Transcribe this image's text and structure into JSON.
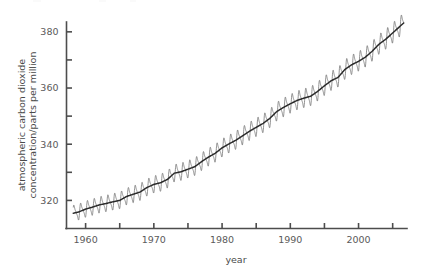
{
  "chart_data": {
    "type": "line",
    "title": "",
    "subtitle": "",
    "xlabel": "year",
    "ylabel": "atmospheric carbon dioxide concentration/parts per million",
    "ylabel_line1": "atmospheric carbon dioxide",
    "ylabel_line2": "concentration/parts per million",
    "xlim": [
      1957.2,
      2007.1
    ],
    "ylim": [
      310.0,
      383.5
    ],
    "grid": false,
    "legend": null,
    "x_major_ticks": [
      1960,
      1970,
      1980,
      1990,
      2000
    ],
    "x_major_tick_labels": [
      "1960",
      "1970",
      "1980",
      "1990",
      "2000"
    ],
    "x_minor_ticks": [
      1965,
      1975,
      1985,
      1995,
      2005
    ],
    "y_major_ticks": [
      320,
      340,
      360,
      380
    ],
    "y_major_tick_labels": [
      "320",
      "340",
      "360",
      "380"
    ],
    "y_minor_ticks": [
      330,
      350,
      370
    ],
    "series": [
      {
        "name": "monthly mean CO2 (seasonal cycle)",
        "color": "#6e6e6e",
        "x": [
          1958.0,
          1958.5,
          1959.0,
          1959.5,
          1960.0,
          1960.5,
          1961.0,
          1961.5,
          1962.0,
          1962.5,
          1963.0,
          1963.5,
          1964.0,
          1964.5,
          1965.0,
          1965.5,
          1966.0,
          1966.5,
          1967.0,
          1967.5,
          1968.0,
          1968.5,
          1969.0,
          1969.5,
          1970.0,
          1970.5,
          1971.0,
          1971.5,
          1972.0,
          1972.5,
          1973.0,
          1973.5,
          1974.0,
          1974.5,
          1975.0,
          1975.5,
          1976.0,
          1976.5,
          1977.0,
          1977.5,
          1978.0,
          1978.5,
          1979.0,
          1979.5,
          1980.0,
          1980.5,
          1981.0,
          1981.5,
          1982.0,
          1982.5,
          1983.0,
          1983.5,
          1984.0,
          1984.5,
          1985.0,
          1985.5,
          1986.0,
          1986.5,
          1987.0,
          1987.5,
          1988.0,
          1988.5,
          1989.0,
          1989.5,
          1990.0,
          1990.5,
          1991.0,
          1991.5,
          1992.0,
          1992.5,
          1993.0,
          1993.5,
          1994.0,
          1994.5,
          1995.0,
          1995.5,
          1996.0,
          1996.5,
          1997.0,
          1997.5,
          1998.0,
          1998.5,
          1999.0,
          1999.5,
          2000.0,
          2000.5,
          2001.0,
          2001.5,
          2002.0,
          2002.5,
          2003.0,
          2003.5,
          2004.0,
          2004.5,
          2005.0,
          2005.5,
          2006.0,
          2006.5
        ],
        "description": "Mauna Loa monthly mean CO2 showing annual sawtooth oscillation superimposed on rising trend"
      },
      {
        "name": "seasonally adjusted trend",
        "color": "#2b2b2b",
        "description": "Smooth rising trend line through the seasonal oscillations"
      }
    ],
    "annual_trend": {
      "years": [
        1958,
        1959,
        1960,
        1961,
        1962,
        1963,
        1964,
        1965,
        1966,
        1967,
        1968,
        1969,
        1970,
        1971,
        1972,
        1973,
        1974,
        1975,
        1976,
        1977,
        1978,
        1979,
        1980,
        1981,
        1982,
        1983,
        1984,
        1985,
        1986,
        1987,
        1988,
        1989,
        1990,
        1991,
        1992,
        1993,
        1994,
        1995,
        1996,
        1997,
        1998,
        1999,
        2000,
        2001,
        2002,
        2003,
        2004,
        2005,
        2006
      ],
      "values": [
        315.3,
        315.9,
        316.9,
        317.6,
        318.4,
        318.9,
        319.5,
        320.0,
        321.4,
        322.2,
        323.0,
        324.6,
        325.7,
        326.3,
        327.5,
        329.7,
        330.2,
        331.1,
        332.0,
        333.8,
        335.4,
        336.8,
        338.7,
        340.1,
        341.4,
        343.0,
        344.6,
        346.0,
        347.4,
        349.2,
        351.6,
        353.1,
        354.4,
        355.6,
        356.4,
        357.1,
        358.8,
        360.8,
        362.6,
        363.8,
        366.6,
        368.3,
        369.5,
        371.0,
        373.1,
        375.6,
        377.4,
        379.6,
        381.8
      ]
    },
    "seasonal_amplitude_ppm": {
      "start": 5.6,
      "end": 7.0,
      "note": "peak-to-trough, peak in May, minimum in late September"
    },
    "data_source_note": "",
    "read_values": {
      "first_point_year": 1958,
      "first_point_ppm": 315,
      "last_point_year": 2006.5,
      "last_point_ppm": 382
    }
  },
  "axes": {
    "x_title": "year",
    "y_title_line1": "atmospheric carbon dioxide",
    "y_title_line2": "concentration/parts per million"
  },
  "ticks": {
    "y": [
      "380",
      "360",
      "340",
      "320"
    ],
    "x": [
      "1960",
      "1970",
      "1980",
      "1990",
      "2000"
    ]
  },
  "colors": {
    "background": "#ffffff",
    "axis": "#4d4d4d",
    "tick_text": "#5a5a5a",
    "seasonal_line": "#6e6e6e",
    "trend_line": "#2b2b2b"
  }
}
